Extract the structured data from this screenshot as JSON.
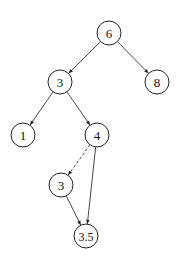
{
  "diagram": {
    "type": "binary-search-tree",
    "nodes": [
      {
        "id": "n6",
        "label": "6",
        "x": 109,
        "y": 33
      },
      {
        "id": "n3",
        "label": "3",
        "x": 60,
        "y": 82
      },
      {
        "id": "n8",
        "label": "8",
        "x": 157,
        "y": 82
      },
      {
        "id": "n1",
        "label": "1",
        "x": 23,
        "y": 135
      },
      {
        "id": "n4",
        "label": "4",
        "x": 97,
        "y": 135
      },
      {
        "id": "n3b",
        "label": "3",
        "x": 61,
        "y": 185
      },
      {
        "id": "n35",
        "label": "3.5",
        "x": 86,
        "y": 236
      }
    ],
    "edges": [
      {
        "from": "n6",
        "to": "n3",
        "style": "solid"
      },
      {
        "from": "n6",
        "to": "n8",
        "style": "solid"
      },
      {
        "from": "n3",
        "to": "n1",
        "style": "solid"
      },
      {
        "from": "n3",
        "to": "n4",
        "style": "solid"
      },
      {
        "from": "n4",
        "to": "n3b",
        "style": "dashed"
      },
      {
        "from": "n4",
        "to": "n35",
        "style": "solid"
      },
      {
        "from": "n3b",
        "to": "n35",
        "style": "solid"
      }
    ],
    "node_radius": 12,
    "colors": {
      "stroke": "#222222",
      "background": "#ffffff"
    }
  }
}
